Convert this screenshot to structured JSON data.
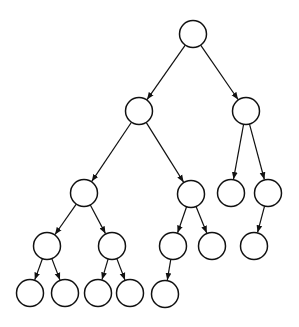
{
  "diagram": {
    "type": "tree",
    "stroke_color": "#111111",
    "fill_color": "#ffffff",
    "node_radius": 13.5,
    "nodes": [
      {
        "id": "n0",
        "x": 193,
        "y": 34
      },
      {
        "id": "n1",
        "x": 139,
        "y": 111
      },
      {
        "id": "n2",
        "x": 246,
        "y": 111
      },
      {
        "id": "n3",
        "x": 84,
        "y": 193
      },
      {
        "id": "n4",
        "x": 191,
        "y": 194
      },
      {
        "id": "n5",
        "x": 231,
        "y": 193
      },
      {
        "id": "n6",
        "x": 268,
        "y": 193
      },
      {
        "id": "n7",
        "x": 47,
        "y": 246
      },
      {
        "id": "n8",
        "x": 112,
        "y": 246
      },
      {
        "id": "n9",
        "x": 173,
        "y": 246
      },
      {
        "id": "n10",
        "x": 212,
        "y": 246
      },
      {
        "id": "n11",
        "x": 254,
        "y": 246
      },
      {
        "id": "n12",
        "x": 30,
        "y": 293
      },
      {
        "id": "n13",
        "x": 65,
        "y": 293
      },
      {
        "id": "n14",
        "x": 98,
        "y": 293
      },
      {
        "id": "n15",
        "x": 130,
        "y": 293
      },
      {
        "id": "n16",
        "x": 165,
        "y": 294
      }
    ],
    "edges": [
      [
        "n0",
        "n1"
      ],
      [
        "n0",
        "n2"
      ],
      [
        "n1",
        "n3"
      ],
      [
        "n1",
        "n4"
      ],
      [
        "n2",
        "n5"
      ],
      [
        "n2",
        "n6"
      ],
      [
        "n3",
        "n7"
      ],
      [
        "n3",
        "n8"
      ],
      [
        "n4",
        "n9"
      ],
      [
        "n4",
        "n10"
      ],
      [
        "n6",
        "n11"
      ],
      [
        "n7",
        "n12"
      ],
      [
        "n7",
        "n13"
      ],
      [
        "n8",
        "n14"
      ],
      [
        "n8",
        "n15"
      ],
      [
        "n9",
        "n16"
      ]
    ]
  }
}
